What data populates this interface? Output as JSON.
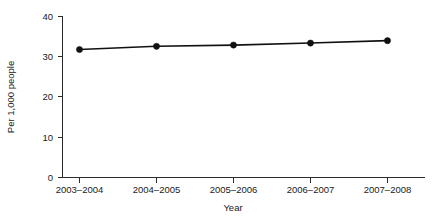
{
  "chart_data": {
    "type": "line",
    "title": "",
    "subtitle": "",
    "xlabel": "Year",
    "ylabel": "Per 1,000 people",
    "categories": [
      "2003–2004",
      "2004–2005",
      "2005–2006",
      "2006–2007",
      "2007–2008"
    ],
    "values": [
      31.8,
      32.6,
      32.9,
      33.4,
      34.0
    ],
    "series": [
      {
        "name": "Rate per 1,000 people",
        "values": [
          31.8,
          32.6,
          32.9,
          33.4,
          34.0
        ]
      }
    ],
    "ylim": [
      0,
      40
    ],
    "yticks": [
      0,
      10,
      20,
      30,
      40
    ],
    "ytick_labels": [
      "0",
      "10",
      "20",
      "30",
      "40"
    ],
    "xtick_labels": [
      "2003–2004",
      "2004–2005",
      "2005–2006",
      "2006–2007",
      "2007–2008"
    ],
    "grid": false,
    "legend": false,
    "legend_position": "none",
    "marker": "filled-circle",
    "line_color": "#111111",
    "marker_color": "#111111",
    "axis_color": "#2b2b2b",
    "background_color": "#ffffff"
  },
  "axis": {
    "y_title": "Per 1,000 people",
    "x_title": "Year",
    "y_labels": [
      "40",
      "30",
      "20",
      "10",
      "0"
    ],
    "x_labels": [
      "2003–2004",
      "2004–2005",
      "2005–2006",
      "2006–2007",
      "2007–2008"
    ]
  }
}
